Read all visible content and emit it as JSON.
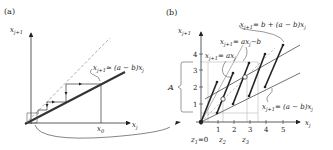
{
  "panel_a": {
    "label": "(a)",
    "y_axis_label": "x",
    "y_axis_sub": "j+1",
    "x_axis_label": "x",
    "x_axis_sub": "j",
    "x0_label": "x",
    "x0_sub": "0",
    "line_label_lhs": "x",
    "line_label_lhs_sub": "j+1",
    "line_label_rhs": "≈ (a − b)x",
    "line_label_rhs_sub": "j"
  },
  "panel_b": {
    "label": "(b)",
    "y_axis_label": "x",
    "y_axis_sub": "j+1",
    "x_axis_label": "x",
    "x_axis_sub": "j",
    "y_ticks": [
      "1",
      "2",
      "3",
      "4"
    ],
    "x_ticks": [
      "1",
      "2",
      "3",
      "4",
      "5"
    ],
    "set_label": "A",
    "eq_upper": "x",
    "eq_upper_sub": "j+1",
    "eq_upper_rhs": "= b + (a − b)x",
    "eq_upper_rhs_sub": "j",
    "eq_mid": "x",
    "eq_mid_sub": "j+1",
    "eq_mid_rhs": "= ax",
    "eq_mid_rhs_sub": "j",
    "eq_mid_tail": "−b",
    "eq_ax": "x",
    "eq_ax_sub": "j+1",
    "eq_ax_rhs": "= ax",
    "eq_ax_rhs_sub": "j",
    "eq_lower": "x",
    "eq_lower_sub": "j+1",
    "eq_lower_rhs": "= (a − b)x",
    "eq_lower_rhs_sub": "j",
    "z1_label": "z",
    "z1_sub": "1",
    "z1_value": "=0",
    "z2_label": "z",
    "z2_sub": "2",
    "z3_label": "z",
    "z3_sub": "3"
  }
}
